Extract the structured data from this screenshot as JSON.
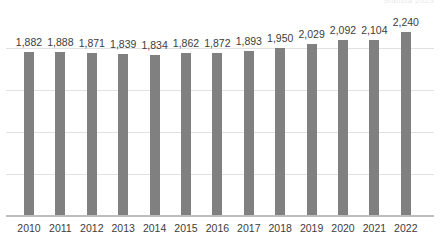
{
  "watermark": {
    "text": "Statista 2023"
  },
  "chart_data": {
    "type": "bar",
    "title": "",
    "subtitle": "",
    "xlabel": "",
    "ylabel": "",
    "categories": [
      "2010",
      "2011",
      "2012",
      "2013",
      "2014",
      "2015",
      "2016",
      "2017",
      "2018",
      "2019",
      "2020",
      "2021",
      "2022"
    ],
    "values": [
      1882,
      1888,
      1871,
      1839,
      1834,
      1862,
      1872,
      1893,
      1950,
      2029,
      2092,
      2104,
      2240
    ],
    "value_labels": [
      "1,882",
      "1,888",
      "1,871",
      "1,839",
      "1,834",
      "1,862",
      "1,872",
      "1,893",
      "1,950",
      "2,029",
      "2,092",
      "2,104",
      "2,240"
    ],
    "tick_labels": [
      "2010",
      "2011",
      "2012",
      "2013",
      "2014",
      "2015",
      "2016",
      "2017",
      "2018",
      "2019",
      "2020",
      "2021",
      "2022"
    ],
    "series": [
      {
        "name": "",
        "values": [
          1882,
          1888,
          1871,
          1839,
          1834,
          1862,
          1872,
          1893,
          1950,
          2029,
          2092,
          2104,
          2240
        ]
      }
    ],
    "ylim": [
      -1052,
      1052
    ],
    "visible_value_range": [
      1834,
      2240
    ],
    "grid": true,
    "gridlines_visible": 4,
    "legend": false,
    "legend_position": "none",
    "data_labels": true,
    "bar_color": "#808080",
    "gridline_color": "#e2e2e2",
    "axis_color": "#bdbdbd",
    "text_color": "#3c3c3c",
    "background_color": "#ffffff",
    "annotations": []
  },
  "geometry": {
    "baseline_y": 216,
    "bar_width": 10,
    "first_bar_x": 29,
    "bar_pitch": 31.4,
    "px_per_unit": 0.0559,
    "gridline_y": [
      48,
      90,
      132,
      174
    ],
    "label_offset_y": 16
  }
}
